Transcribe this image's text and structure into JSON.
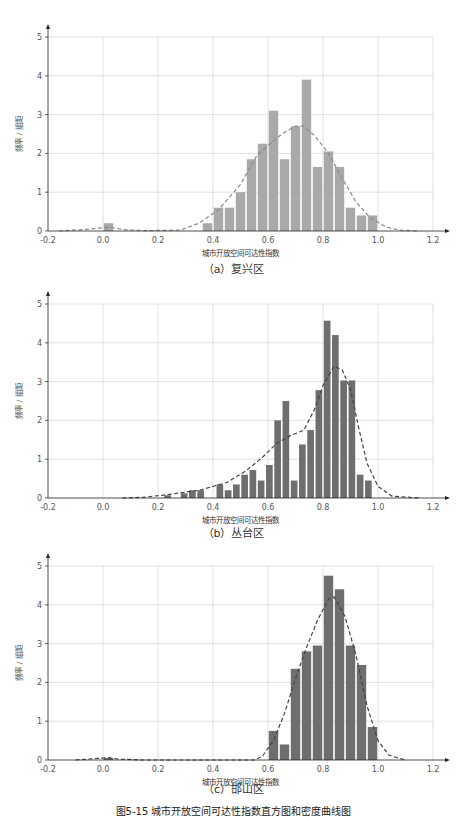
{
  "figure_caption": "图5-15  城市开放空间可达性指数直方图和密度曲线图",
  "chart_data": [
    {
      "type": "bar",
      "subtype": "histogram-with-density",
      "caption": "（a）复兴区",
      "xlabel": "城市开放空间可达性指数",
      "ylabel": "频率 / 组距",
      "xlim": [
        -0.2,
        1.2
      ],
      "ylim": [
        0,
        5
      ],
      "xticks": [
        "-0.2",
        "0.0",
        "0.2",
        "0.4",
        "0.6",
        "0.8",
        "1.0",
        "1.2"
      ],
      "yticks": [
        "0",
        "1",
        "2",
        "3",
        "4",
        "5"
      ],
      "grid": true,
      "bar_color": "#a9a9a9",
      "curve_color": "#8a8a8a",
      "bin_width": 0.04,
      "bins": [
        0.0,
        0.36,
        0.4,
        0.44,
        0.48,
        0.52,
        0.56,
        0.6,
        0.64,
        0.68,
        0.72,
        0.76,
        0.8,
        0.84,
        0.88,
        0.92,
        0.96
      ],
      "values": [
        0.2,
        0.2,
        0.6,
        0.6,
        1.0,
        1.85,
        2.25,
        3.1,
        1.85,
        2.7,
        3.9,
        1.65,
        2.05,
        1.65,
        0.6,
        0.4,
        0.4
      ],
      "density_curve": [
        [
          -0.16,
          0.0
        ],
        [
          -0.05,
          0.05
        ],
        [
          0.02,
          0.1
        ],
        [
          0.08,
          0.03
        ],
        [
          0.15,
          0.01
        ],
        [
          0.28,
          0.02
        ],
        [
          0.35,
          0.2
        ],
        [
          0.42,
          0.55
        ],
        [
          0.5,
          1.2
        ],
        [
          0.56,
          1.95
        ],
        [
          0.6,
          2.2
        ],
        [
          0.65,
          2.5
        ],
        [
          0.7,
          2.7
        ],
        [
          0.73,
          2.7
        ],
        [
          0.77,
          2.45
        ],
        [
          0.82,
          2.0
        ],
        [
          0.87,
          1.35
        ],
        [
          0.92,
          0.75
        ],
        [
          0.97,
          0.35
        ],
        [
          1.03,
          0.1
        ],
        [
          1.08,
          0.02
        ],
        [
          1.15,
          0.0
        ]
      ]
    },
    {
      "type": "bar",
      "subtype": "histogram-with-density",
      "caption": "（b）丛台区",
      "xlabel": "城市开放空间可达性指数",
      "ylabel": "频率 / 组距",
      "xlim": [
        -0.2,
        1.2
      ],
      "ylim": [
        0,
        5
      ],
      "xticks": [
        "-0.2",
        "0.0",
        "0.2",
        "0.4",
        "0.6",
        "0.8",
        "1.0",
        "1.2"
      ],
      "yticks": [
        "0",
        "1",
        "2",
        "3",
        "4",
        "5"
      ],
      "grid": true,
      "bar_color": "#6e6e6e",
      "curve_color": "#444444",
      "bin_width": 0.03,
      "bins": [
        0.22,
        0.28,
        0.31,
        0.34,
        0.41,
        0.44,
        0.47,
        0.5,
        0.53,
        0.56,
        0.59,
        0.62,
        0.65,
        0.68,
        0.71,
        0.74,
        0.77,
        0.8,
        0.83,
        0.86,
        0.89,
        0.92,
        0.95
      ],
      "values": [
        0.07,
        0.12,
        0.2,
        0.2,
        0.35,
        0.2,
        0.35,
        0.6,
        0.72,
        0.45,
        0.85,
        2.0,
        2.5,
        0.45,
        1.38,
        1.75,
        2.78,
        4.57,
        4.2,
        3.03,
        3.03,
        0.6,
        0.45
      ],
      "density_curve": [
        [
          0.07,
          0.0
        ],
        [
          0.15,
          0.02
        ],
        [
          0.25,
          0.1
        ],
        [
          0.35,
          0.2
        ],
        [
          0.45,
          0.4
        ],
        [
          0.52,
          0.7
        ],
        [
          0.58,
          1.05
        ],
        [
          0.63,
          1.4
        ],
        [
          0.68,
          1.6
        ],
        [
          0.73,
          1.75
        ],
        [
          0.77,
          2.3
        ],
        [
          0.8,
          2.9
        ],
        [
          0.84,
          3.4
        ],
        [
          0.87,
          3.3
        ],
        [
          0.9,
          2.8
        ],
        [
          0.93,
          1.8
        ],
        [
          0.96,
          0.9
        ],
        [
          1.0,
          0.3
        ],
        [
          1.05,
          0.05
        ],
        [
          1.15,
          0.0
        ]
      ]
    },
    {
      "type": "bar",
      "subtype": "histogram-with-density",
      "caption": "（c）邯山区",
      "xlabel": "城市开放空间可达性指数",
      "ylabel": "频率 / 组距",
      "xlim": [
        -0.2,
        1.2
      ],
      "ylim": [
        0,
        5
      ],
      "xticks": [
        "-0.2",
        "0.0",
        "0.2",
        "0.4",
        "0.6",
        "0.8",
        "1.0",
        "1.2"
      ],
      "yticks": [
        "0",
        "1",
        "2",
        "3",
        "4",
        "5"
      ],
      "grid": true,
      "bar_color": "#6e6e6e",
      "curve_color": "#444444",
      "bin_width": 0.04,
      "bins": [
        0.0,
        0.6,
        0.64,
        0.68,
        0.72,
        0.76,
        0.8,
        0.84,
        0.88,
        0.92,
        0.96
      ],
      "values": [
        0.05,
        0.75,
        0.4,
        2.35,
        2.8,
        2.95,
        4.75,
        4.4,
        2.95,
        2.45,
        0.85
      ],
      "density_curve": [
        [
          -0.1,
          0.0
        ],
        [
          -0.02,
          0.04
        ],
        [
          0.02,
          0.06
        ],
        [
          0.06,
          0.02
        ],
        [
          0.15,
          0.0
        ],
        [
          0.55,
          0.0
        ],
        [
          0.58,
          0.1
        ],
        [
          0.62,
          0.5
        ],
        [
          0.66,
          1.2
        ],
        [
          0.7,
          2.1
        ],
        [
          0.74,
          2.9
        ],
        [
          0.78,
          3.6
        ],
        [
          0.82,
          4.15
        ],
        [
          0.84,
          4.2
        ],
        [
          0.88,
          3.7
        ],
        [
          0.92,
          2.7
        ],
        [
          0.96,
          1.4
        ],
        [
          1.0,
          0.5
        ],
        [
          1.04,
          0.12
        ],
        [
          1.1,
          0.0
        ]
      ]
    }
  ]
}
